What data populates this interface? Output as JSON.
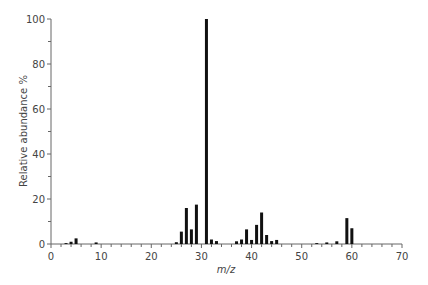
{
  "chart_data": {
    "type": "bar",
    "title": "",
    "xlabel": "m/z",
    "ylabel": "Relative abundance %",
    "xlim": [
      0,
      70
    ],
    "ylim": [
      0,
      100
    ],
    "x_ticks": [
      0,
      10,
      20,
      30,
      40,
      50,
      60,
      70
    ],
    "y_ticks": [
      0,
      20,
      40,
      60,
      80,
      100
    ],
    "grid": false,
    "legend": null,
    "x": [
      3,
      4,
      5,
      9,
      25,
      26,
      27,
      28,
      29,
      31,
      32,
      33,
      37,
      38,
      39,
      40,
      41,
      42,
      43,
      44,
      45,
      53,
      55,
      57,
      59,
      60
    ],
    "values": [
      0.4,
      1,
      2.5,
      0.7,
      0.8,
      5.5,
      16,
      6.5,
      17.5,
      100,
      2,
      1.3,
      1.2,
      2,
      6.5,
      1.8,
      8.5,
      14,
      4,
      1.3,
      1.8,
      0.4,
      0.7,
      1.2,
      11.5,
      7
    ]
  }
}
